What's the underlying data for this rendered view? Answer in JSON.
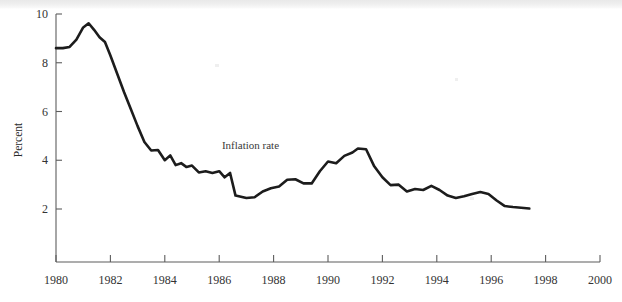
{
  "figure": {
    "background_color": "#ffffff",
    "line_color": "#1c1c1c",
    "axis_color": "#5d5d5d",
    "annotation_label": "Inflation rate",
    "y_axis_title": "Percent"
  },
  "chart_data": {
    "type": "line",
    "title": "",
    "xlabel": "",
    "ylabel": "Percent",
    "xlim": [
      1980,
      2000
    ],
    "ylim": [
      0,
      10
    ],
    "grid": false,
    "legend_position": "inline-annotation",
    "annotations": [
      {
        "text": "Inflation rate",
        "x": 1986.1,
        "y": 4.45
      }
    ],
    "xticks": [
      1980,
      1982,
      1984,
      1986,
      1988,
      1990,
      1992,
      1994,
      1996,
      1998,
      2000
    ],
    "xtick_labels": [
      "1980",
      "1982",
      "1984",
      "1986",
      "1988",
      "1990",
      "1992",
      "1994",
      "1996",
      "1998",
      "2000"
    ],
    "yticks": [
      2,
      4,
      6,
      8,
      10
    ],
    "ytick_labels": [
      "2",
      "4",
      "6",
      "8",
      "10"
    ],
    "series": [
      {
        "name": "Inflation rate",
        "color": "#1c1c1c",
        "x": [
          1980.0,
          1980.25,
          1980.5,
          1980.75,
          1981.0,
          1981.2,
          1981.4,
          1981.6,
          1981.8,
          1982.0,
          1982.25,
          1982.5,
          1982.75,
          1983.0,
          1983.25,
          1983.5,
          1983.75,
          1984.0,
          1984.2,
          1984.4,
          1984.6,
          1984.8,
          1985.0,
          1985.25,
          1985.5,
          1985.75,
          1986.0,
          1986.2,
          1986.4,
          1986.6,
          1986.8,
          1987.0,
          1987.3,
          1987.6,
          1987.9,
          1988.2,
          1988.5,
          1988.8,
          1989.1,
          1989.4,
          1989.7,
          1990.0,
          1990.3,
          1990.6,
          1990.9,
          1991.1,
          1991.4,
          1991.7,
          1992.0,
          1992.3,
          1992.6,
          1992.9,
          1993.2,
          1993.5,
          1993.8,
          1994.1,
          1994.4,
          1994.7,
          1995.0,
          1995.3,
          1995.6,
          1995.9,
          1996.2,
          1996.5,
          1996.8,
          1997.1,
          1997.4
        ],
        "y": [
          8.6,
          8.6,
          8.65,
          8.95,
          9.45,
          9.62,
          9.35,
          9.05,
          8.85,
          8.3,
          7.55,
          6.8,
          6.1,
          5.4,
          4.75,
          4.4,
          4.42,
          4.0,
          4.2,
          3.8,
          3.88,
          3.72,
          3.78,
          3.5,
          3.55,
          3.48,
          3.55,
          3.3,
          3.48,
          2.55,
          2.5,
          2.45,
          2.48,
          2.72,
          2.85,
          2.92,
          3.2,
          3.22,
          3.05,
          3.05,
          3.55,
          3.95,
          3.88,
          4.18,
          4.32,
          4.48,
          4.45,
          3.75,
          3.3,
          2.98,
          3.0,
          2.72,
          2.82,
          2.78,
          2.95,
          2.78,
          2.55,
          2.45,
          2.52,
          2.62,
          2.7,
          2.62,
          2.35,
          2.12,
          2.08,
          2.05,
          2.02
        ]
      }
    ]
  }
}
